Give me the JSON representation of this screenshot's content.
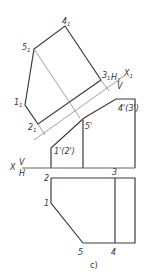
{
  "figure": {
    "caption": "c)",
    "axis_main": {
      "label": "X",
      "upper": "V",
      "lower": "H"
    },
    "axis_aux": {
      "label": "X",
      "label_sub": "1",
      "upper": "H",
      "upper_sub": "1",
      "lower": "V"
    },
    "aux_view_labels": [
      {
        "base": "4",
        "sub": "1"
      },
      {
        "base": "5",
        "sub": "1"
      },
      {
        "base": "3",
        "sub": "1"
      },
      {
        "base": "1",
        "sub": "1"
      },
      {
        "base": "2",
        "sub": "1"
      }
    ],
    "front_view_labels": {
      "p4_3": "4'(3')",
      "p5": "5'",
      "p1_2": "1'(2')"
    },
    "top_view_labels": {
      "p1": "1",
      "p2": "2",
      "p3": "3",
      "p4": "4",
      "p5": "5"
    },
    "colors": {
      "thick": "#3a3a3a",
      "thin": "#777777"
    }
  }
}
